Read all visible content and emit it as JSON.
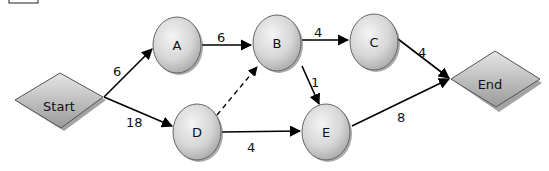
{
  "diagram": {
    "type": "network-graph",
    "corner_box": true,
    "nodes": [
      {
        "id": "start",
        "label": "Start",
        "shape": "diamond"
      },
      {
        "id": "A",
        "label": "A",
        "shape": "circle"
      },
      {
        "id": "B",
        "label": "B",
        "shape": "circle"
      },
      {
        "id": "C",
        "label": "C",
        "shape": "circle"
      },
      {
        "id": "D",
        "label": "D",
        "shape": "circle"
      },
      {
        "id": "E",
        "label": "E",
        "shape": "circle"
      },
      {
        "id": "end",
        "label": "End",
        "shape": "diamond"
      }
    ],
    "edges": [
      {
        "from": "Start",
        "to": "A",
        "label": "6",
        "style": "solid"
      },
      {
        "from": "Start",
        "to": "D",
        "label": "18",
        "style": "solid"
      },
      {
        "from": "A",
        "to": "B",
        "label": "6",
        "style": "solid"
      },
      {
        "from": "B",
        "to": "C",
        "label": "4",
        "style": "solid"
      },
      {
        "from": "B",
        "to": "E",
        "label": "1",
        "style": "solid"
      },
      {
        "from": "D",
        "to": "B",
        "label": "",
        "style": "dashed"
      },
      {
        "from": "D",
        "to": "E",
        "label": "4",
        "style": "solid"
      },
      {
        "from": "C",
        "to": "End",
        "label": "4",
        "style": "solid"
      },
      {
        "from": "E",
        "to": "End",
        "label": "8",
        "style": "solid"
      }
    ]
  },
  "labels": {
    "start": "Start",
    "a": "A",
    "b": "B",
    "c": "C",
    "d": "D",
    "e": "E",
    "end": "End",
    "edge_start_a": "6",
    "edge_start_d": "18",
    "edge_a_b": "6",
    "edge_b_c": "4",
    "edge_b_e": "1",
    "edge_d_e": "4",
    "edge_c_end": "4",
    "edge_e_end": "8"
  }
}
